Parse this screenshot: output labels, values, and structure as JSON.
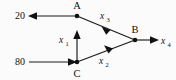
{
  "diagram": {
    "type": "directed-flow-network",
    "background_color": "#fbfbfb",
    "stroke_color": "#1a1a1a",
    "nodes": [
      {
        "id": "A",
        "label": "A",
        "x": 77,
        "y": 16,
        "label_x": 77,
        "label_y": 9
      },
      {
        "id": "B",
        "label": "B",
        "x": 135,
        "y": 40,
        "label_x": 135,
        "label_y": 33
      },
      {
        "id": "C",
        "label": "C",
        "x": 77,
        "y": 62,
        "label_x": 77,
        "label_y": 76
      }
    ],
    "external_values": [
      {
        "id": "inflow",
        "label": "80",
        "x": 16,
        "y": 65
      },
      {
        "id": "outflow",
        "label": "20",
        "x": 16,
        "y": 19
      }
    ],
    "edges": [
      {
        "id": "edge-a-out",
        "from": "A",
        "to": "outflow",
        "label": "",
        "subscript": "",
        "direction": "left"
      },
      {
        "id": "edge-in-c",
        "from": "inflow",
        "to": "C",
        "label": "",
        "subscript": "",
        "direction": "right"
      },
      {
        "id": "edge-c-a",
        "from": "C",
        "to": "A",
        "label": "x",
        "subscript": "1",
        "direction": "up",
        "label_x": 62,
        "label_y": 42
      },
      {
        "id": "edge-c-b",
        "from": "C",
        "to": "B",
        "label": "x",
        "subscript": "2",
        "direction": "up-right",
        "label_x": 103,
        "label_y": 63
      },
      {
        "id": "edge-a-b",
        "from": "A",
        "to": "B",
        "label": "x",
        "subscript": "3",
        "direction": "down-right",
        "label_x": 104,
        "label_y": 18
      },
      {
        "id": "edge-b-out",
        "from": "B",
        "to": "terminal",
        "label": "x",
        "subscript": "4",
        "direction": "right",
        "label_x": 163,
        "label_y": 43
      }
    ]
  }
}
